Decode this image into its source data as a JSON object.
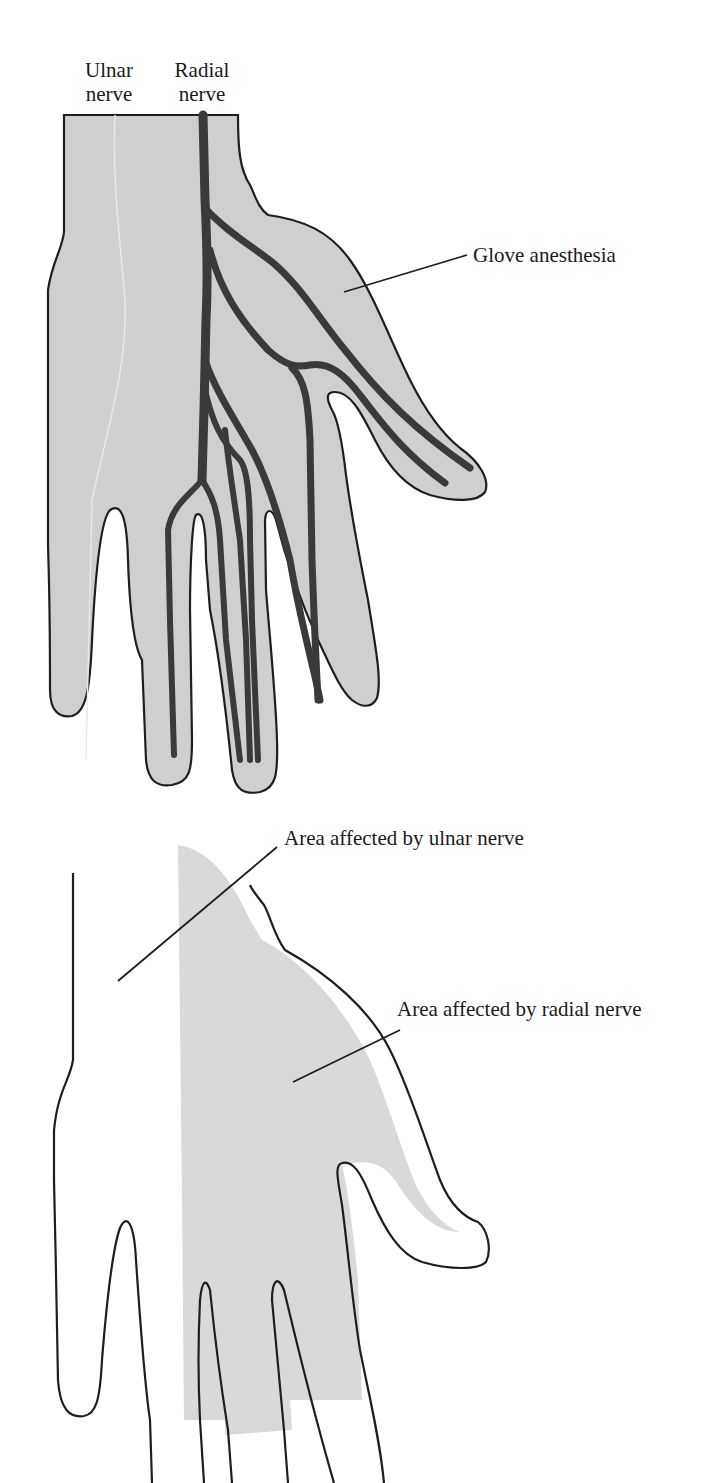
{
  "figure": {
    "top_diagram": {
      "labels": {
        "ulnar_line1": "Ulnar",
        "ulnar_line2": "nerve",
        "radial_line1": "Radial",
        "radial_line2": "nerve",
        "glove": "Glove anesthesia"
      }
    },
    "bottom_diagram": {
      "labels": {
        "ulnar_area": "Area affected by ulnar nerve",
        "radial_area": "Area affected by radial nerve"
      }
    },
    "colors": {
      "hand_fill": "#cfcfcf",
      "radial_area_fill": "#d9d9d9",
      "nerve": "#3a3a3a",
      "outline": "#1e1e1e",
      "background": "#ffffff"
    }
  }
}
